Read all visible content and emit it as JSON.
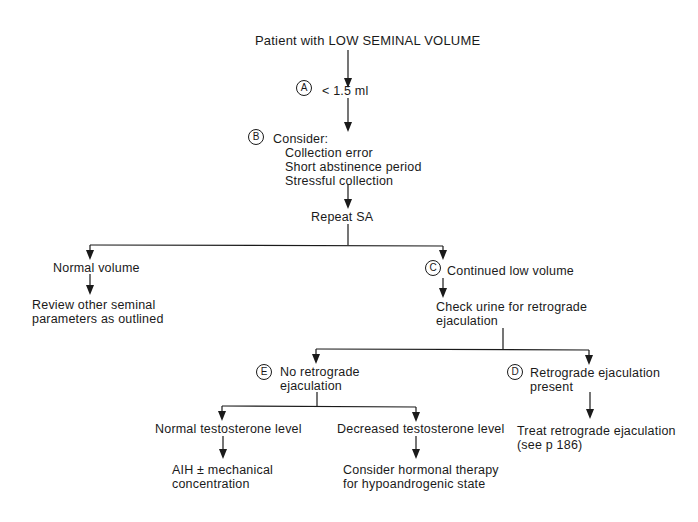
{
  "flowchart": {
    "root": "Patient with LOW SEMINAL VOLUME",
    "step_a": {
      "badge": "A",
      "label": "< 1.5 ml"
    },
    "step_b": {
      "badge": "B",
      "label": "Consider:",
      "items": [
        "Collection error",
        "Short abstinence period",
        "Stressful collection"
      ]
    },
    "repeat": "Repeat SA",
    "normal_volume": "Normal volume",
    "review": [
      "Review other seminal",
      "parameters as outlined"
    ],
    "step_c": {
      "badge": "C",
      "label": "Continued low volume"
    },
    "check_urine": [
      "Check urine for retrograde",
      "ejaculation"
    ],
    "step_e": {
      "badge": "E",
      "lines": [
        "No retrograde",
        "ejaculation"
      ]
    },
    "step_d": {
      "badge": "D",
      "lines": [
        "Retrograde ejaculation",
        "present"
      ]
    },
    "normal_testosterone": "Normal testosterone level",
    "decreased_testosterone": "Decreased testosterone level",
    "aih": [
      "AIH ± mechanical",
      "concentration"
    ],
    "hormonal": [
      "Consider hormonal therapy",
      "for hypoandrogenic state"
    ],
    "treat": [
      "Treat retrograde ejaculation",
      "(see p 186)"
    ]
  }
}
